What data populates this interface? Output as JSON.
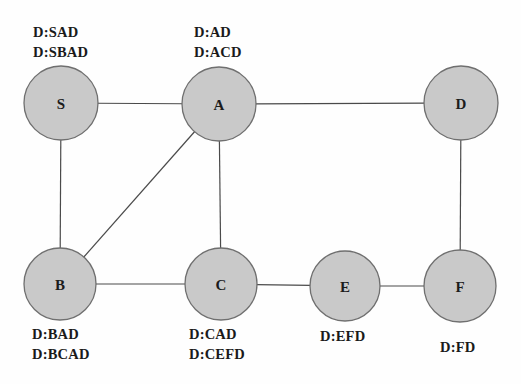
{
  "diagram": {
    "background_color": "#fefefe",
    "node_fill": "#c9c9c9",
    "node_stroke": "#6f6f6f",
    "edge_color": "#4a4a4a",
    "nodes": [
      {
        "id": "S",
        "label": "S",
        "cx": 61,
        "cy": 103,
        "r": 37
      },
      {
        "id": "A",
        "label": "A",
        "cx": 219,
        "cy": 104,
        "r": 37
      },
      {
        "id": "D",
        "label": "D",
        "cx": 461,
        "cy": 103,
        "r": 37
      },
      {
        "id": "B",
        "label": "B",
        "cx": 60,
        "cy": 284,
        "r": 36
      },
      {
        "id": "C",
        "label": "C",
        "cx": 221,
        "cy": 284,
        "r": 36
      },
      {
        "id": "E",
        "label": "E",
        "cx": 345,
        "cy": 286,
        "r": 35
      },
      {
        "id": "F",
        "label": "F",
        "cx": 460,
        "cy": 286,
        "r": 36
      }
    ],
    "edges": [
      {
        "from": "S",
        "to": "A"
      },
      {
        "from": "S",
        "to": "B"
      },
      {
        "from": "A",
        "to": "D"
      },
      {
        "from": "A",
        "to": "B"
      },
      {
        "from": "A",
        "to": "C"
      },
      {
        "from": "B",
        "to": "C"
      },
      {
        "from": "C",
        "to": "E"
      },
      {
        "from": "E",
        "to": "F"
      },
      {
        "from": "F",
        "to": "D"
      }
    ],
    "annotations": [
      {
        "node": "S",
        "position": "above",
        "x": 33,
        "y": 22,
        "lines": [
          "D:SAD",
          "D:SBAD"
        ]
      },
      {
        "node": "A",
        "position": "above",
        "x": 194,
        "y": 22,
        "lines": [
          "D:AD",
          "D:ACD"
        ]
      },
      {
        "node": "B",
        "position": "below",
        "x": 32,
        "y": 324,
        "lines": [
          "D:BAD",
          "D:BCAD"
        ]
      },
      {
        "node": "C",
        "position": "below",
        "x": 189,
        "y": 324,
        "lines": [
          "D:CAD",
          "D:CEFD"
        ]
      },
      {
        "node": "E",
        "position": "below",
        "x": 320,
        "y": 326,
        "lines": [
          "D:EFD"
        ]
      },
      {
        "node": "F",
        "position": "below",
        "x": 440,
        "y": 337,
        "lines": [
          "D:FD"
        ]
      }
    ]
  }
}
